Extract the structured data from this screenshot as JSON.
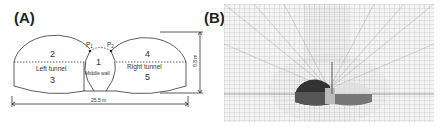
{
  "panels": {
    "a": {
      "label": "(A)",
      "regions": {
        "r1": "1",
        "r2": "2",
        "r3": "3",
        "r4": "4",
        "r5": "5"
      },
      "left_tunnel": "Left tunnel",
      "right_tunnel": "Right tunnel",
      "middle_wall": "Middle wall",
      "points": {
        "p1": "P",
        "p1_sub": "1",
        "p2": "P",
        "p2_sub": "2"
      },
      "height_dim": "9.8 m",
      "width_dim": "25.5 m"
    },
    "b": {
      "label": "(B)"
    }
  }
}
